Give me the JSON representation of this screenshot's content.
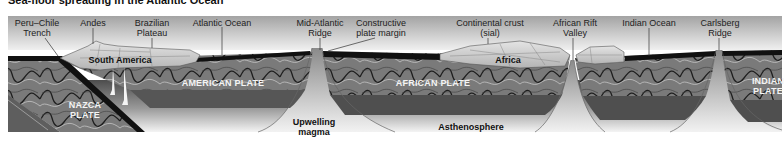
{
  "title": "Sea-floor spreading in the Atlantic Ocean",
  "top_labels": [
    {
      "id": "peru-chile-trench",
      "line1": "Peru–Chile",
      "line2": "Trench",
      "x": 37
    },
    {
      "id": "andes",
      "line1": "Andes",
      "line2": "",
      "x": 97
    },
    {
      "id": "brazilian-plateau",
      "line1": "Brazilian",
      "line2": "Plateau",
      "x": 152
    },
    {
      "id": "atlantic-ocean",
      "line1": "Atlantic Ocean",
      "line2": "",
      "x": 222
    },
    {
      "id": "mid-atlantic-ridge",
      "line1": "Mid-Atlantic",
      "line2": "Ridge",
      "x": 320
    },
    {
      "id": "constructive-plate-margin",
      "line1": "Constructive",
      "line2": "plate margin",
      "x": 381
    },
    {
      "id": "continental-crust",
      "line1": "Continental crust",
      "line2": "(sial)",
      "x": 490
    },
    {
      "id": "african-rift-valley",
      "line1": "African Rift",
      "line2": "Valley",
      "x": 575
    },
    {
      "id": "indian-ocean",
      "line1": "Indian Ocean",
      "line2": "",
      "x": 649
    },
    {
      "id": "carlsberg-ridge",
      "line1": "Carlsberg",
      "line2": "Ridge",
      "x": 720
    }
  ],
  "continents": {
    "south_america": "South America",
    "africa": "Africa"
  },
  "plates": {
    "american": "AMERICAN PLATE",
    "african": "AFRICAN PLATE",
    "nazca_line1": "NAZCA",
    "nazca_line2": "PLATE",
    "indian_line1": "INDIAN",
    "indian_line2": "PLATE"
  },
  "mantle_labels": {
    "upwelling_line1": "Upwelling",
    "upwelling_line2": "magma",
    "asthenosphere": "Asthenosphere"
  },
  "colors": {
    "sky_top": "#9a9a9a",
    "sky_bottom": "#eeeeee",
    "ocean_floor": "#1a1a1a",
    "lithosphere": "#6e6e6e",
    "lithosphere_dark": "#4a4a4a",
    "continent": "#c8c8c8",
    "asthenosphere_top": "#555555",
    "asthenosphere_bottom": "#f2f2f2"
  }
}
